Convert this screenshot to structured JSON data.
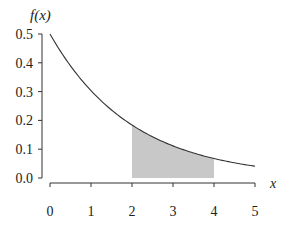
{
  "chart_data": {
    "type": "line",
    "title": "",
    "xlabel": "x",
    "ylabel": "f(x)",
    "function": "f(x) = 0.5 * exp(-0.5 * x)",
    "xlim": [
      0,
      5
    ],
    "ylim": [
      0.0,
      0.5
    ],
    "x_ticks": [
      "0",
      "1",
      "2",
      "3",
      "4",
      "5"
    ],
    "y_ticks": [
      "0.0",
      "0.1",
      "0.2",
      "0.3",
      "0.4",
      "0.5"
    ],
    "grid": false,
    "legend": null,
    "series": [
      {
        "name": "f(x)",
        "x": [
          0,
          0.5,
          1,
          1.5,
          2,
          2.5,
          3,
          3.5,
          4,
          4.5,
          5
        ],
        "values": [
          0.5,
          0.389,
          0.303,
          0.236,
          0.184,
          0.143,
          0.112,
          0.087,
          0.068,
          0.053,
          0.041
        ]
      }
    ],
    "shaded_region": {
      "x_from": 2,
      "x_to": 4,
      "color": "#c8c8c8",
      "description": "area under f(x) between x=2 and x=4"
    }
  },
  "labels": {
    "y_axis_label": "f(x)",
    "x_axis_label": "x"
  },
  "colors": {
    "curve": "#333333",
    "axis": "#333333",
    "shade": "#c8c8c8"
  }
}
